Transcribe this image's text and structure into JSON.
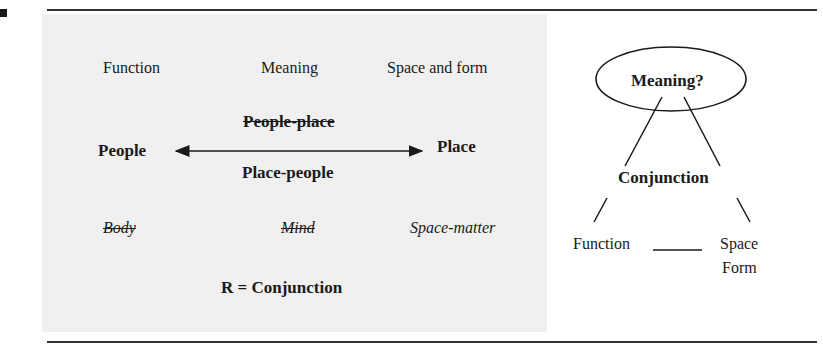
{
  "left_panel": {
    "top_row": {
      "function": "Function",
      "meaning": "Meaning",
      "space_and_form": "Space and form"
    },
    "axis": {
      "left": "People",
      "right": "Place",
      "above_struck": "People-place",
      "below": "Place-people"
    },
    "bottom_row": {
      "body_struck": "Body",
      "mind_struck": "Mind",
      "space_matter": "Space-matter"
    },
    "equation": "R = Conjunction"
  },
  "right_panel": {
    "ellipse_label": "Meaning?",
    "middle_label": "Conjunction",
    "left_leaf": "Function",
    "right_leaf_line1": "Space",
    "right_leaf_line2": "Form"
  },
  "colors": {
    "background": "#ffffff",
    "shaded_box": "#f0f0f0",
    "ink": "#1a1a1a"
  }
}
